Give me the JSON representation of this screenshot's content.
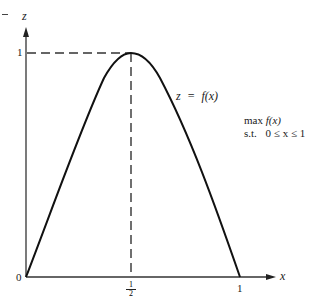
{
  "diagram": {
    "type": "function-plot",
    "axes": {
      "vertical_label": "z",
      "horizontal_label": "x",
      "origin_label": "0",
      "z_tick_label": "1",
      "x_tick_mid_numerator": "1",
      "x_tick_mid_denominator": "2",
      "x_tick_end_label": "1"
    },
    "curve": {
      "label_lhs": "z",
      "label_eq": "=",
      "label_rhs": "f(x)",
      "peak": {
        "x": 0.5,
        "z": 1
      },
      "endpoints": [
        {
          "x": 0,
          "z": 0
        },
        {
          "x": 1,
          "z": 0
        }
      ]
    },
    "problem": {
      "objective_prefix": "max",
      "objective_fn": "f(x)",
      "constraint_prefix": "s.t.",
      "constraint": "0 ≤ x ≤ 1"
    },
    "colors": {
      "curve": "#111111",
      "axes": "#333333",
      "dashes": "#333333",
      "background": "#ffffff"
    }
  }
}
